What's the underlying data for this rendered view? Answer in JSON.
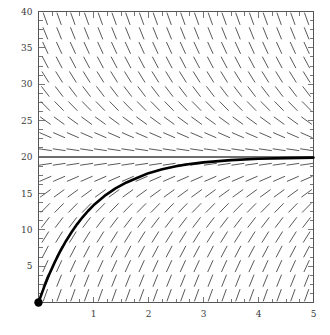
{
  "chart_data": {
    "type": "line",
    "title": "",
    "subtitle": "",
    "xlabel": "",
    "ylabel": "",
    "xlim": [
      0,
      5
    ],
    "ylim": [
      0,
      40
    ],
    "grid": false,
    "legend": null,
    "x_ticks_major": [
      1,
      2,
      3,
      4,
      5
    ],
    "x_tick_labels": [
      "1",
      "2",
      "3",
      "4",
      "5"
    ],
    "x_tick_minor_step": 0.25,
    "y_ticks_major": [
      5,
      10,
      15,
      20,
      25,
      30,
      35,
      40
    ],
    "y_tick_labels": [
      "5",
      "10",
      "15",
      "20",
      "25",
      "30",
      "35",
      "40"
    ],
    "y_tick_minor_step": 1.25,
    "annotations": [
      {
        "name": "equilibrium-line",
        "kind": "horizontal-line",
        "y": 20,
        "color": "#6e6e6e",
        "label": ""
      },
      {
        "name": "initial-condition-point",
        "kind": "point",
        "x": 0,
        "y": 0,
        "color": "#000000",
        "label": ""
      }
    ],
    "slope_field": {
      "name": "direction-field",
      "equation_form": "dy/dx = k (20 - y)",
      "k": 1.1,
      "nx": 20,
      "ny": 20,
      "x_start": 0.125,
      "x_step": 0.25,
      "y_start": 1.0,
      "y_step": 2.0,
      "segment_length_px": 13,
      "color": "#5a5a5a"
    },
    "series": [
      {
        "name": "solution-curve",
        "color": "#000000",
        "linewidth": 2.6,
        "equation": "y = 20 (1 - e^(-1.1 x))",
        "x": [
          0.0,
          0.1,
          0.2,
          0.3,
          0.4,
          0.5,
          0.6,
          0.7,
          0.8,
          0.9,
          1.0,
          1.2,
          1.4,
          1.6,
          1.8,
          2.0,
          2.25,
          2.5,
          2.75,
          3.0,
          3.5,
          4.0,
          4.5,
          5.0
        ],
        "values": [
          0.0,
          2.08,
          3.95,
          5.62,
          7.11,
          8.46,
          9.66,
          10.74,
          11.71,
          12.58,
          13.36,
          14.65,
          15.68,
          16.5,
          17.15,
          17.78,
          18.33,
          18.72,
          19.03,
          19.26,
          19.57,
          19.75,
          19.85,
          19.92
        ]
      }
    ]
  },
  "axes": {
    "name": "cartesian-axes",
    "frame_color": "#555555",
    "background": "#ffffff"
  }
}
